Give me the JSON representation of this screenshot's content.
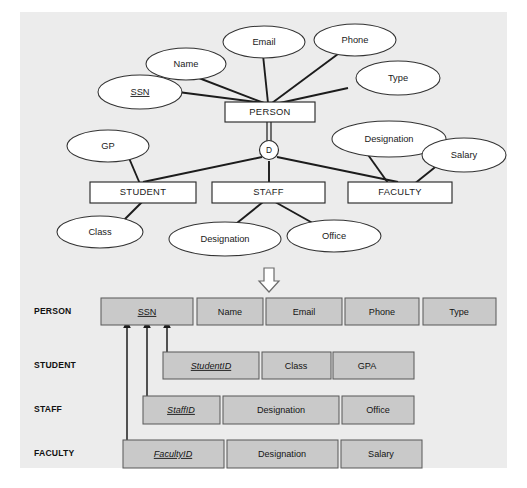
{
  "figure": {
    "panel_background": "#ececec",
    "cell_fill": "#c9c9c9",
    "line_color": "#1c1c1c"
  },
  "er_diagram": {
    "superclass": {
      "name": "PERSON"
    },
    "specialization": {
      "symbol": "D",
      "meaning": "disjoint"
    },
    "superclass_attributes": [
      {
        "label": "SSN",
        "key": true
      },
      {
        "label": "Name",
        "key": false
      },
      {
        "label": "Email",
        "key": false
      },
      {
        "label": "Phone",
        "key": false
      },
      {
        "label": "Type",
        "key": false
      }
    ],
    "subclasses": [
      {
        "name": "STUDENT",
        "attributes": [
          "GP",
          "Class"
        ]
      },
      {
        "name": "STAFF",
        "attributes": [
          "Designation",
          "Office"
        ]
      },
      {
        "name": "FACULTY",
        "attributes": [
          "Designation",
          "Salary"
        ]
      }
    ]
  },
  "transition": {
    "arrow": "down-arrow",
    "glyph": "⇩"
  },
  "relational_schema": {
    "tables": [
      {
        "name": "PERSON",
        "columns": [
          {
            "label": "SSN",
            "primary_key": true,
            "italic": false
          },
          {
            "label": "Name",
            "primary_key": false,
            "italic": false
          },
          {
            "label": "Email",
            "primary_key": false,
            "italic": false
          },
          {
            "label": "Phone",
            "primary_key": false,
            "italic": false
          },
          {
            "label": "Type",
            "primary_key": false,
            "italic": false
          }
        ]
      },
      {
        "name": "STUDENT",
        "columns": [
          {
            "label": "StudentID",
            "primary_key": true,
            "italic": true
          },
          {
            "label": "Class",
            "primary_key": false,
            "italic": false
          },
          {
            "label": "GPA",
            "primary_key": false,
            "italic": false
          }
        ]
      },
      {
        "name": "STAFF",
        "columns": [
          {
            "label": "StaffID",
            "primary_key": true,
            "italic": true
          },
          {
            "label": "Designation",
            "primary_key": false,
            "italic": false
          },
          {
            "label": "Office",
            "primary_key": false,
            "italic": false
          }
        ]
      },
      {
        "name": "FACULTY",
        "columns": [
          {
            "label": "FacultyID",
            "primary_key": true,
            "italic": true
          },
          {
            "label": "Designation",
            "primary_key": false,
            "italic": false
          },
          {
            "label": "Salary",
            "primary_key": false,
            "italic": false
          }
        ]
      }
    ],
    "foreign_keys": [
      {
        "from": "FACULTY.FacultyID",
        "to": "PERSON.SSN"
      },
      {
        "from": "STAFF.StaffID",
        "to": "PERSON.SSN"
      },
      {
        "from": "STUDENT.StudentID",
        "to": "PERSON.SSN"
      }
    ]
  }
}
